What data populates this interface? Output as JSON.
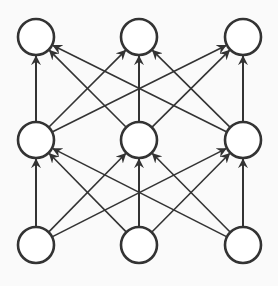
{
  "diagram": {
    "type": "fully-connected-network",
    "background": "#fafafa",
    "stroke_color": "#333333",
    "node_radius": 18,
    "layers": [
      {
        "name": "output",
        "y": 37,
        "nodes": [
          36,
          139,
          243
        ]
      },
      {
        "name": "hidden",
        "y": 140,
        "nodes": [
          36,
          139,
          243
        ]
      },
      {
        "name": "input",
        "y": 245,
        "nodes": [
          36,
          139,
          243
        ]
      }
    ],
    "edges_direction": "upward",
    "connections": "all-to-all between adjacent layers"
  }
}
